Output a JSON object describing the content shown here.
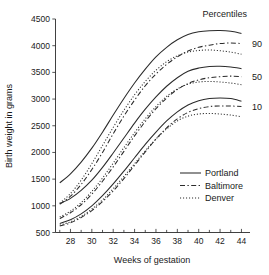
{
  "chart_data": {
    "type": "line",
    "title": "",
    "xlabel": "Weeks of gestation",
    "ylabel": "Birth weight in grams",
    "xlim": [
      26.6,
      44.8
    ],
    "ylim": [
      500,
      4500
    ],
    "xticks": [
      28,
      30,
      32,
      34,
      36,
      38,
      40,
      42,
      44
    ],
    "xticks_minor": [
      27,
      29,
      31,
      33,
      35,
      37,
      39,
      41,
      43
    ],
    "yticks": [
      500,
      1000,
      1500,
      2000,
      2500,
      3000,
      3500,
      4000,
      4500
    ],
    "grid": false,
    "legend_position": "lower-right",
    "group_title": "Percentiles",
    "group_labels": [
      "90",
      "50",
      "10"
    ],
    "legend": [
      {
        "name": "Portland",
        "style": "solid"
      },
      {
        "name": "Baltimore",
        "style": "dash-dot"
      },
      {
        "name": "Denver",
        "style": "dotted"
      }
    ],
    "x": [
      27,
      28,
      29,
      30,
      31,
      32,
      33,
      34,
      35,
      36,
      37,
      38,
      39,
      40,
      41,
      42,
      43,
      44
    ],
    "groups": [
      {
        "percentile": "90",
        "series": [
          {
            "name": "Portland",
            "style": "solid",
            "values": [
              1430,
              1600,
              1820,
              2080,
              2380,
              2700,
              3010,
              3300,
              3560,
              3790,
              3970,
              4110,
              4210,
              4260,
              4280,
              4285,
              4270,
              4230
            ]
          },
          {
            "name": "Baltimore",
            "style": "dash-dot",
            "values": [
              1030,
              1180,
              1400,
              1680,
              2000,
              2350,
              2680,
              2980,
              3250,
              3470,
              3650,
              3790,
              3900,
              3970,
              4010,
              4040,
              4050,
              4040
            ]
          },
          {
            "name": "Denver",
            "style": "dotted",
            "values": [
              1050,
              1230,
              1480,
              1790,
              2130,
              2470,
              2790,
              3080,
              3330,
              3540,
              3700,
              3810,
              3880,
              3910,
              3920,
              3905,
              3880,
              3840
            ]
          }
        ]
      },
      {
        "percentile": "50",
        "series": [
          {
            "name": "Portland",
            "style": "solid",
            "values": [
              1040,
              1140,
              1290,
              1480,
              1720,
              1990,
              2270,
              2550,
              2810,
              3040,
              3240,
              3400,
              3520,
              3580,
              3610,
              3615,
              3600,
              3570
            ]
          },
          {
            "name": "Baltimore",
            "style": "dash-dot",
            "values": [
              760,
              870,
              1020,
              1220,
              1460,
              1730,
              2020,
              2310,
              2580,
              2820,
              3020,
              3180,
              3290,
              3360,
              3400,
              3420,
              3430,
              3420
            ]
          },
          {
            "name": "Denver",
            "style": "dotted",
            "values": [
              790,
              900,
              1060,
              1270,
              1520,
              1800,
              2090,
              2370,
              2630,
              2860,
              3050,
              3190,
              3280,
              3320,
              3330,
              3320,
              3300,
              3270
            ]
          }
        ]
      },
      {
        "percentile": "10",
        "series": [
          {
            "name": "Portland",
            "style": "solid",
            "values": [
              670,
              740,
              850,
              1000,
              1190,
              1410,
              1650,
              1900,
              2150,
              2380,
              2590,
              2760,
              2890,
              2970,
              3010,
              3020,
              3010,
              2960
            ]
          },
          {
            "name": "Baltimore",
            "style": "dash-dot",
            "values": [
              620,
              680,
              780,
              910,
              1080,
              1280,
              1510,
              1760,
              2010,
              2250,
              2460,
              2630,
              2750,
              2820,
              2860,
              2870,
              2870,
              2860
            ]
          },
          {
            "name": "Denver",
            "style": "dotted",
            "values": [
              640,
              700,
              800,
              940,
              1110,
              1320,
              1550,
              1790,
              2030,
              2250,
              2440,
              2590,
              2680,
              2720,
              2730,
              2720,
              2700,
              2670
            ]
          }
        ]
      }
    ]
  }
}
